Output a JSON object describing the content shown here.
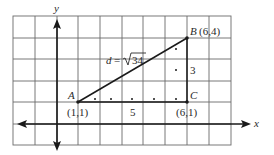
{
  "diagram": {
    "axes": {
      "x_label": "x",
      "y_label": "y"
    },
    "points": {
      "A": {
        "name": "A",
        "coord": "(1,1)",
        "x": 1,
        "y": 1
      },
      "B": {
        "name": "B",
        "coord": "(6,4)",
        "x": 6,
        "y": 4
      },
      "C": {
        "name": "C",
        "coord": "(6,1)",
        "x": 6,
        "y": 1
      }
    },
    "labels": {
      "B_full": "B (6,4)",
      "distance_prefix": "d = ",
      "distance_radical": "34",
      "horizontal_leg": "5",
      "vertical_leg": "3"
    },
    "grid": {
      "x_min": -2,
      "x_max": 8,
      "y_min": -1,
      "y_max": 5
    },
    "colors": {
      "grid": "#5a5a5a",
      "line": "#1a1a1a",
      "text": "#2a2a2a",
      "background": "#ffffff"
    }
  }
}
